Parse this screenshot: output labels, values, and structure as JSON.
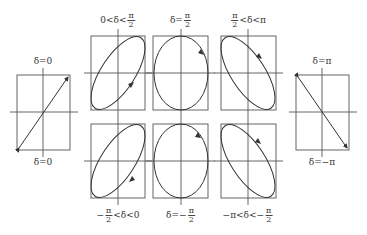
{
  "figure": {
    "type": "polarization-ellipses-diagram",
    "stroke_color": "#333333",
    "frame_color": "#555555",
    "panels": [
      {
        "id": "delta-0",
        "shape": "line",
        "direction": "up-right",
        "label_top": "δ=0",
        "label_bottom": "δ=0"
      },
      {
        "id": "delta-0-to-pi2",
        "shape": "ellipse",
        "tilt": "positive",
        "rotation": "counterclockwise",
        "label": {
          "pre": "0<δ<",
          "num": "π",
          "den": "2",
          "post": ""
        }
      },
      {
        "id": "delta-pi2",
        "shape": "ellipse",
        "tilt": "none",
        "rotation": "clockwise",
        "label": {
          "pre": "δ=",
          "num": "π",
          "den": "2",
          "post": ""
        }
      },
      {
        "id": "delta-pi2-to-pi",
        "shape": "ellipse",
        "tilt": "negative",
        "rotation": "clockwise",
        "label": {
          "pre": "",
          "num": "π",
          "den": "2",
          "post": "<δ<π"
        }
      },
      {
        "id": "delta-pi",
        "shape": "line",
        "direction": "up-left",
        "label_top": "δ=π",
        "label_bottom": "δ=−π"
      },
      {
        "id": "delta-neg-pi2-to-0",
        "shape": "ellipse",
        "tilt": "positive",
        "rotation": "clockwise",
        "label": {
          "pre": "−",
          "num": "π",
          "den": "2",
          "post": "<δ<0"
        }
      },
      {
        "id": "delta-neg-pi2",
        "shape": "ellipse",
        "tilt": "none",
        "rotation": "counterclockwise",
        "label": {
          "pre": "δ=−",
          "num": "π",
          "den": "2",
          "post": ""
        }
      },
      {
        "id": "delta-neg-pi-to-neg-pi2",
        "shape": "ellipse",
        "tilt": "negative",
        "rotation": "counterclockwise",
        "label": {
          "pre": "−π<δ<−",
          "num": "π",
          "den": "2",
          "post": ""
        }
      }
    ]
  }
}
